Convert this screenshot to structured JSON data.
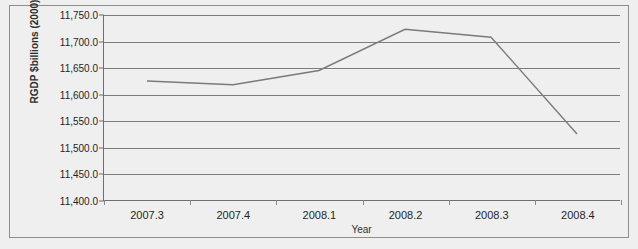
{
  "figure": {
    "title_sliver": "",
    "frame_color": "#8d8d8d",
    "background": "#efefef"
  },
  "axes": {
    "y_title": "RGDP $billions (2000)",
    "x_title": "Year"
  },
  "chart_data": {
    "type": "line",
    "title": "",
    "xlabel": "Year",
    "ylabel": "RGDP $billions (2000)",
    "categories": [
      "2007.3",
      "2007.4",
      "2008.1",
      "2008.2",
      "2008.3",
      "2008.4"
    ],
    "values": [
      11625.0,
      11618.0,
      11645.0,
      11723.0,
      11708.0,
      11525.0
    ],
    "series": [
      {
        "name": "RGDP",
        "color": "#7a7a7a",
        "values": [
          11625.0,
          11618.0,
          11645.0,
          11723.0,
          11708.0,
          11525.0
        ]
      }
    ],
    "ylim": [
      11400.0,
      11750.0
    ],
    "ytick_values": [
      11400.0,
      11450.0,
      11500.0,
      11550.0,
      11600.0,
      11650.0,
      11700.0,
      11750.0
    ],
    "ytick_labels": [
      "11,400.0",
      "11,450.0",
      "11,500.0",
      "11,550.0",
      "11,600.0",
      "11,650.0",
      "11,700.0",
      "11,750.0"
    ],
    "grid": "horizontal",
    "legend": "none",
    "markers": "none",
    "line_color": "#7a7a7a",
    "gridline_color": "#7d7d7d"
  }
}
